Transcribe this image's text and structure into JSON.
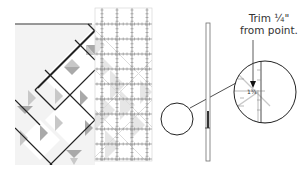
{
  "diagram": {
    "callout": {
      "line1": "Trim ¼\"",
      "line2": "from point."
    },
    "ruler_labels": [
      "1",
      "2",
      "3",
      "4",
      "5",
      "6",
      "7",
      "8"
    ],
    "magnifier_labels": {
      "upper": "1¾",
      "lower": "1½"
    },
    "colors": {
      "background": "#ffffff",
      "quilt_light": "#f1f1f1",
      "quilt_mid": "#c8c8c8",
      "quilt_dark": "#a9a9a9",
      "seam_line": "#222222",
      "ruler_grid": "#8a8a8a",
      "ruler_faint": "#e6e6e6",
      "edge_bar": "#6f6f6f"
    },
    "icons": {
      "arrow": "down-arrow-icon",
      "magnifier": "magnifier-circle-icon"
    }
  }
}
